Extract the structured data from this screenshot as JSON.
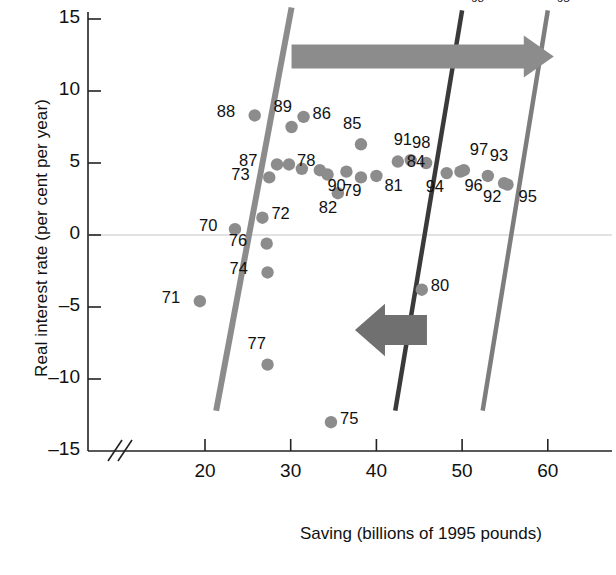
{
  "chart_data": {
    "type": "scatter",
    "title": "",
    "xlabel": "Saving (billions of 1995 pounds)",
    "ylabel": "Real interest rate (per cent per year)",
    "xlim": [
      14,
      66
    ],
    "ylim": [
      -15,
      16
    ],
    "xticks": [
      20,
      30,
      40,
      50,
      60
    ],
    "yticks": [
      15,
      10,
      5,
      0,
      -5,
      -10,
      -15
    ],
    "grid": false,
    "axis_break": true,
    "legend": "none",
    "point_color": "#8c8c8c",
    "points": [
      {
        "label": "70",
        "x": 23.5,
        "y": 0.4,
        "lx": -26,
        "ly": -9
      },
      {
        "label": "71",
        "x": 19.4,
        "y": -4.6,
        "lx": -28,
        "ly": -9
      },
      {
        "label": "72",
        "x": 26.7,
        "y": 1.2,
        "lx": 9,
        "ly": -10
      },
      {
        "label": "73",
        "x": 27.5,
        "y": 4.0,
        "lx": -28,
        "ly": -8
      },
      {
        "label": "74",
        "x": 27.3,
        "y": -2.6,
        "lx": -28,
        "ly": -9
      },
      {
        "label": "75",
        "x": 34.7,
        "y": -13.0,
        "lx": 9,
        "ly": -9
      },
      {
        "label": "76",
        "x": 27.2,
        "y": -0.6,
        "lx": -28,
        "ly": -9
      },
      {
        "label": "77",
        "x": 27.3,
        "y": -9.0,
        "lx": -10,
        "ly": -27
      },
      {
        "label": "78",
        "x": 29.8,
        "y": 4.9,
        "lx": 8,
        "ly": -9
      },
      {
        "label": "79",
        "x": 38.2,
        "y": 4.0,
        "lx": -8,
        "ly": 8
      },
      {
        "label": "80",
        "x": 45.3,
        "y": -3.8,
        "lx": 9,
        "ly": -10
      },
      {
        "label": "81",
        "x": 40.0,
        "y": 4.1,
        "lx": 8,
        "ly": 4
      },
      {
        "label": "82",
        "x": 35.5,
        "y": 2.9,
        "lx": -9,
        "ly": 9
      },
      {
        "label": "83",
        "x": 31.3,
        "y": 4.6,
        "lx": null,
        "ly": null
      },
      {
        "label": "84",
        "x": 42.5,
        "y": 5.1,
        "lx": 9,
        "ly": -6
      },
      {
        "label": "85",
        "x": 38.2,
        "y": 6.3,
        "lx": -8,
        "ly": -26
      },
      {
        "label": "86",
        "x": 31.5,
        "y": 8.2,
        "lx": 9,
        "ly": -9
      },
      {
        "label": "87",
        "x": 28.4,
        "y": 4.9,
        "lx": -28,
        "ly": -9
      },
      {
        "label": "88",
        "x": 25.8,
        "y": 8.3,
        "lx": -28,
        "ly": -9
      },
      {
        "label": "89",
        "x": 30.1,
        "y": 7.5,
        "lx": -8,
        "ly": -26
      },
      {
        "label": "90",
        "x": 36.5,
        "y": 4.4,
        "lx": -9,
        "ly": 8
      },
      {
        "label": "91",
        "x": 44.0,
        "y": 5.2,
        "lx": -7,
        "ly": -26
      },
      {
        "label": "92",
        "x": 54.9,
        "y": 3.6,
        "lx": -11,
        "ly": 8
      },
      {
        "label": "93",
        "x": 53.0,
        "y": 4.1,
        "lx": 2,
        "ly": -26
      },
      {
        "label": "94",
        "x": 48.2,
        "y": 4.3,
        "lx": -11,
        "ly": 8
      },
      {
        "label": "95",
        "x": 55.3,
        "y": 3.5,
        "lx": 11,
        "ly": 6
      },
      {
        "label": "96",
        "x": 49.8,
        "y": 4.4,
        "lx": 4,
        "ly": 8
      },
      {
        "label": "97",
        "x": 50.2,
        "y": 4.5,
        "lx": 6,
        "ly": -26
      },
      {
        "label": "98",
        "x": 45.8,
        "y": 5.0,
        "lx": -4,
        "ly": -26
      },
      {
        "label": "99",
        "x": 33.4,
        "y": 4.5,
        "lx": null,
        "ly": null
      },
      {
        "label": "00",
        "x": 34.3,
        "y": 4.2,
        "lx": null,
        "ly": null
      }
    ],
    "supply_curves": [
      {
        "name": "SS70",
        "label": "SS",
        "sub": "70",
        "color": "#8c8c8c",
        "x_top": 30.1,
        "y_top": 15.8,
        "x_bottom": 21.3,
        "y_bottom": -12.2,
        "width": 6
      },
      {
        "name": "SS98",
        "label": "SS",
        "sub": "98",
        "color": "#3a3a3a",
        "x_top": 50.0,
        "y_top": 15.6,
        "x_bottom": 42.2,
        "y_bottom": -12.2,
        "width": 4.5
      },
      {
        "name": "SS95",
        "label": "SS",
        "sub": "95",
        "color": "#7d7d7d",
        "x_top": 60.0,
        "y_top": 15.6,
        "x_bottom": 52.4,
        "y_bottom": -12.2,
        "width": 4.5
      }
    ],
    "annotations": [
      {
        "name": "rightward-shift-arrow",
        "direction": "right",
        "x_start": 30.1,
        "x_end": 60.7,
        "y": 12.4,
        "color": "#8c8c8c"
      },
      {
        "name": "leftward-shift-arrow",
        "direction": "left",
        "x_start": 45.9,
        "x_end": 37.5,
        "y": -6.6,
        "color": "#707070"
      }
    ]
  }
}
